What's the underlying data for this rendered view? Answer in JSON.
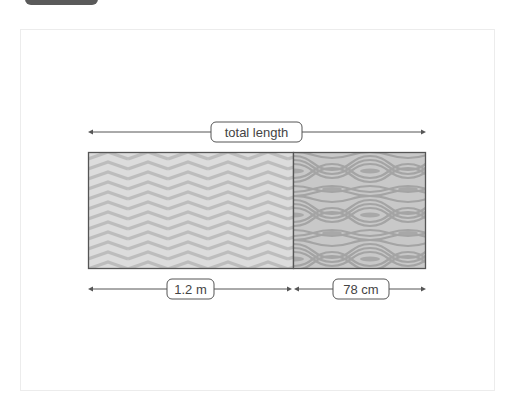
{
  "diagram": {
    "total_label": "total length",
    "segments": [
      {
        "label": "1.2 m",
        "pattern": "chevron-pattern",
        "fill": "#d6d6d6"
      },
      {
        "label": "78 cm",
        "pattern": "wave-pattern",
        "fill": "#b4b4b4"
      }
    ]
  },
  "colors": {
    "tab": "#5a5a5a",
    "outline": "#555555",
    "line": "#555555",
    "text": "#444444"
  }
}
